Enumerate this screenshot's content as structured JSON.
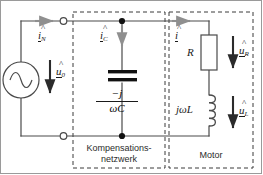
{
  "diagram": {
    "type": "electrical-circuit-schematic",
    "colors": {
      "wire": "#4a4a4a",
      "label": "#1a1a1a",
      "arrow_gray": "#8f8f8f",
      "arrow_dark": "#2b2b2b",
      "dashed_box": "#3a3a3a",
      "frame": "#9a9a9a",
      "capacitor_plate": "#111111"
    },
    "source": {
      "name": "ac-voltage-source",
      "symbol": "sine",
      "voltage_label": "u",
      "voltage_sub": "0"
    },
    "currents": {
      "line_current": {
        "label": "i",
        "sub": "N"
      },
      "capacitor_current": {
        "label": "i",
        "sub": "C"
      },
      "motor_current": {
        "label": "i",
        "sub": ""
      }
    },
    "capacitor": {
      "name": "compensation-capacitor",
      "impedance_numerator": "−j",
      "impedance_denominator": "ωC"
    },
    "resistor": {
      "name": "motor-resistance",
      "label": "R",
      "voltage_label": "u",
      "voltage_sub": "R"
    },
    "inductor": {
      "name": "motor-inductance",
      "label": "jωL",
      "voltage_label": "u",
      "voltage_sub": "L"
    },
    "boxes": {
      "compensation": {
        "line1": "Kompensations-",
        "line2": "netzwerk"
      },
      "motor": {
        "line1": "Motor"
      }
    },
    "terminals": {
      "top": "terminal-top",
      "bottom": "terminal-bottom"
    }
  }
}
